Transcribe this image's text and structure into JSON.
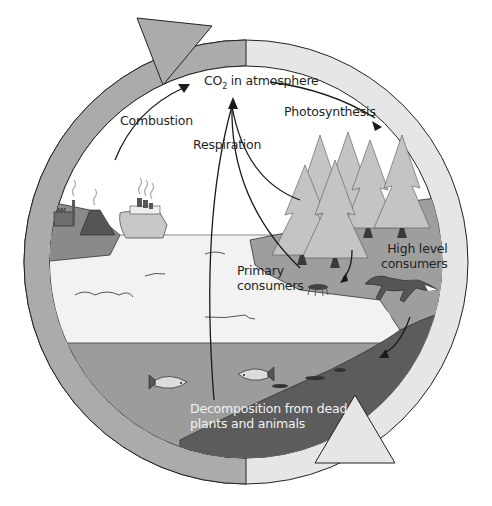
{
  "diagram": {
    "colors": {
      "outer_ring": "#ababab",
      "outer_ring_light": "#e6e6e6",
      "sky": "#ffffff",
      "water_surface": "#f2f2f2",
      "water_deep": "#9c9c9c",
      "land": "#9e9e9e",
      "sediment": "#5c5c5c",
      "tree": "#c4c4c4",
      "trunk": "#3a3a3a",
      "stroke": "#222222"
    },
    "labels": {
      "co2_prefix": "CO",
      "co2_sub": "2",
      "co2_suffix": " in atmosphere",
      "combustion": "Combustion",
      "respiration": "Respiration",
      "photosynthesis": "Photosynthesis",
      "primary_consumers_l1": "Primary",
      "primary_consumers_l2": "consumers",
      "high_level_consumers_l1": "High level",
      "high_level_consumers_l2": "consumers",
      "decomposition_l1": "Decomposition from dead",
      "decomposition_l2": "plants and animals"
    },
    "nodes": [
      {
        "id": "atmosphere",
        "label": "CO2 in atmosphere"
      },
      {
        "id": "industry",
        "label": "Factory, volcano, ship (combustion sources)"
      },
      {
        "id": "forest",
        "label": "Trees (photosynthesis)"
      },
      {
        "id": "primary_consumers",
        "label": "Primary consumers"
      },
      {
        "id": "high_level_consumers",
        "label": "High level consumers"
      },
      {
        "id": "ocean",
        "label": "Ocean with fish"
      },
      {
        "id": "sediment",
        "label": "Decomposition from dead plants and animals"
      }
    ],
    "edges": [
      {
        "from": "industry",
        "to": "atmosphere",
        "label": "Combustion"
      },
      {
        "from": "atmosphere",
        "to": "forest",
        "label": "Photosynthesis"
      },
      {
        "from": "forest",
        "to": "atmosphere",
        "label": "Respiration"
      },
      {
        "from": "primary_consumers",
        "to": "atmosphere",
        "label": "Respiration"
      },
      {
        "from": "ocean",
        "to": "atmosphere",
        "label": "Respiration"
      },
      {
        "from": "forest",
        "to": "primary_consumers",
        "label": ""
      },
      {
        "from": "high_level_consumers",
        "to": "sediment",
        "label": ""
      }
    ]
  }
}
